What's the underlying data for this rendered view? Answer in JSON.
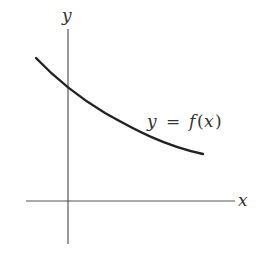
{
  "diagram": {
    "type": "function-graph",
    "axes": {
      "x_label": "x",
      "y_label": "y"
    },
    "curve": {
      "label_var": "y",
      "label_eq": "=",
      "label_func": "f",
      "label_open": "(",
      "label_arg": "x",
      "label_close": ")",
      "description": "decreasing convex curve, crossing positive y-axis"
    },
    "colors": {
      "axis": "#555555",
      "curve": "#222222",
      "text": "#333333",
      "background": "#ffffff"
    }
  }
}
